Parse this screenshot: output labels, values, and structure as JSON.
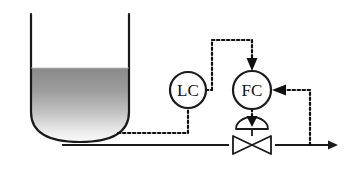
{
  "diagram": {
    "type": "process-control-p-and-id",
    "colors": {
      "line": "#1a1a1a",
      "signal": "#111111",
      "liquid_top": "#8c8c8c",
      "liquid_bottom": "#fbfbfb",
      "background": "#ffffff"
    },
    "vessel": {
      "name": "tank",
      "shape": "open-top vessel with rounded bottom",
      "liquid_level_label": "",
      "level_fraction": 0.52
    },
    "controllers": [
      {
        "id": "lc",
        "label": "LC",
        "name": "level-controller",
        "cx": 188,
        "cy": 90,
        "r": 18
      },
      {
        "id": "fc",
        "label": "FC",
        "name": "flow-controller",
        "cx": 252,
        "cy": 90,
        "r": 19
      }
    ],
    "valve": {
      "name": "control-valve",
      "label": "",
      "cx": 252,
      "cy": 145,
      "actuator": "diaphragm"
    },
    "signals": [
      {
        "name": "level-measurement",
        "from": "tank",
        "to": "lc",
        "style": "dotted"
      },
      {
        "name": "lc-output-setpoint",
        "from": "lc",
        "to": "fc",
        "style": "dotted"
      },
      {
        "name": "flow-measurement",
        "from": "outlet-pipe",
        "to": "fc",
        "style": "dotted"
      },
      {
        "name": "fc-output-to-valve",
        "from": "fc",
        "to": "valve",
        "style": "dotted"
      }
    ],
    "piping": [
      {
        "name": "outlet-pipe",
        "style": "solid",
        "direction": "left-to-right",
        "terminator": "arrow"
      }
    ]
  }
}
